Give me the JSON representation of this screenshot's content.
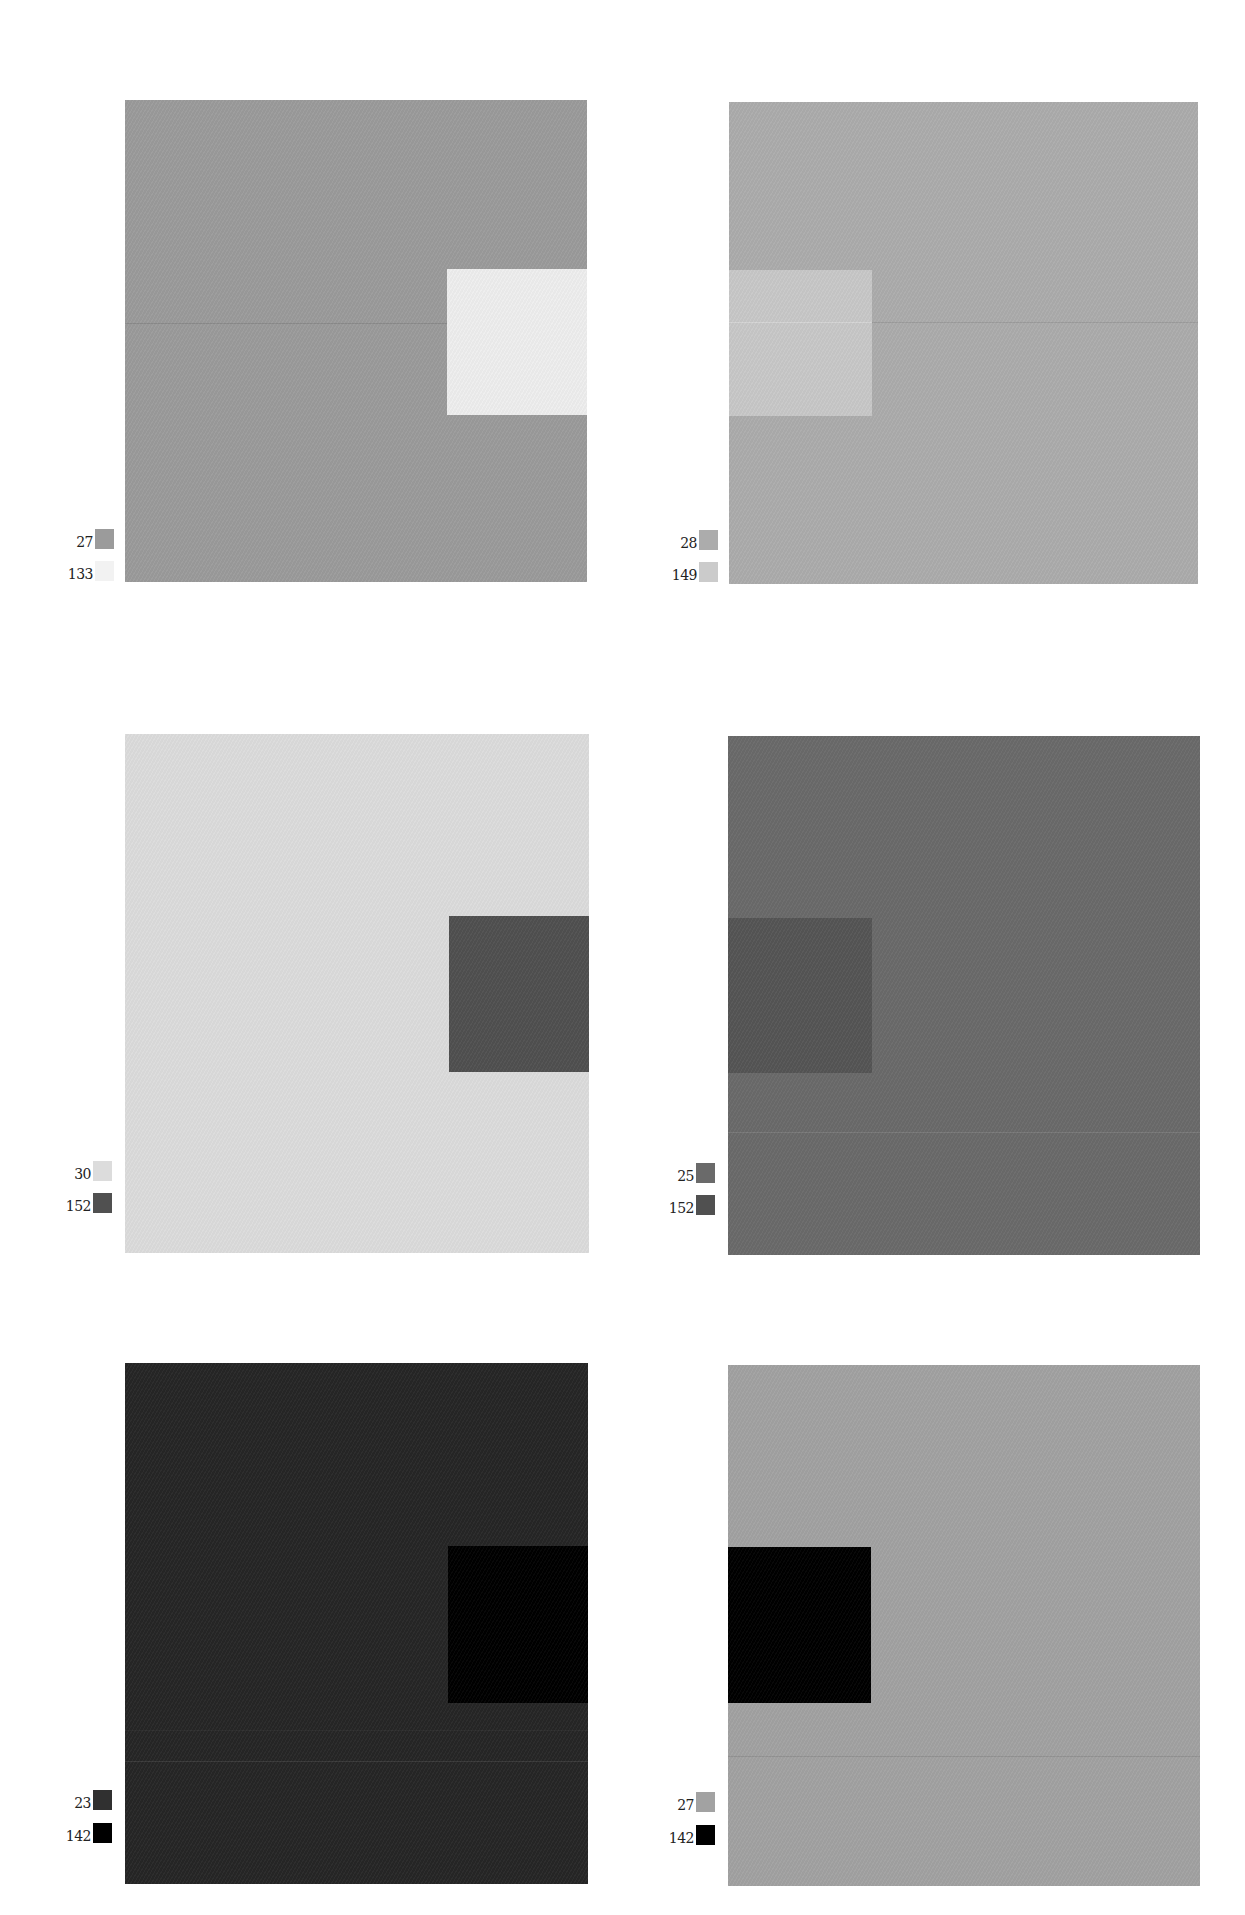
{
  "figure": {
    "plates": [
      {
        "id": "top-left",
        "background_color": "#9b9b9b",
        "inset_color": "#eeeeee",
        "inset_side": "right",
        "seam_color": "#8a8a8a",
        "legend": [
          {
            "label": "27",
            "color": "#9b9b9b"
          },
          {
            "label": "133",
            "color": "#f2f2f2"
          }
        ]
      },
      {
        "id": "top-right",
        "background_color": "#acacac",
        "inset_color": "#c8c8c8",
        "inset_side": "left",
        "seam_color": "#9c9c9c",
        "legend": [
          {
            "label": "28",
            "color": "#acacac"
          },
          {
            "label": "149",
            "color": "#cbcbcb"
          }
        ]
      },
      {
        "id": "middle-left",
        "background_color": "#dcdcdc",
        "inset_color": "#505050",
        "inset_side": "right",
        "seam_color": "#d4d4d4",
        "legend": [
          {
            "label": "30",
            "color": "#dcdcdc"
          },
          {
            "label": "152",
            "color": "#505050"
          }
        ]
      },
      {
        "id": "middle-right",
        "background_color": "#6a6a6a",
        "inset_color": "#555555",
        "inset_side": "left",
        "seam_color": "#7a7a7a",
        "legend": [
          {
            "label": "25",
            "color": "#6a6a6a"
          },
          {
            "label": "152",
            "color": "#505050"
          }
        ]
      },
      {
        "id": "bottom-left",
        "background_color": "#262626",
        "inset_color": "#000000",
        "inset_side": "right",
        "seam_color": "#3a3a3a",
        "legend": [
          {
            "label": "23",
            "color": "#303030"
          },
          {
            "label": "142",
            "color": "#000000"
          }
        ]
      },
      {
        "id": "bottom-right",
        "background_color": "#a2a2a2",
        "inset_color": "#000000",
        "inset_side": "left",
        "seam_color": "#929292",
        "legend": [
          {
            "label": "27",
            "color": "#a2a2a2"
          },
          {
            "label": "142",
            "color": "#000000"
          }
        ]
      }
    ]
  }
}
